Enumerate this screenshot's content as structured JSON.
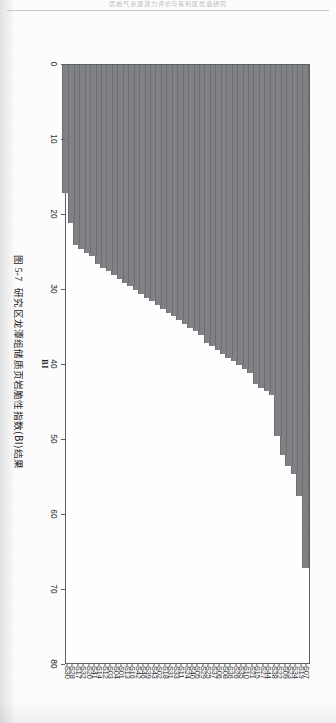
{
  "page": {
    "running_head": "页岩气资源潜力评价与有利区优选研究"
  },
  "figure": {
    "caption_number": "图 5-7",
    "caption_text": "研究区龙潭组储质页岩脆性指数(BI)结果",
    "bar_color": "#808285",
    "axis_color": "#5e6164"
  },
  "chart_data": {
    "type": "bar",
    "orientation": "horizontal",
    "xlabel": "BI",
    "ylabel": "",
    "xlim": [
      0,
      80
    ],
    "xticks": [
      0,
      10,
      20,
      30,
      40,
      50,
      60,
      70,
      80
    ],
    "xtick_labels": [
      "0",
      "10",
      "20",
      "30",
      "40",
      "50",
      "60",
      "70",
      "80"
    ],
    "grid": false,
    "legend": false,
    "categories": [
      "S07",
      "S19",
      "S34",
      "S23",
      "S09",
      "S22",
      "S38",
      "S44",
      "S27",
      "S15",
      "S21",
      "S10",
      "S35",
      "S26",
      "S36",
      "S08",
      "S06",
      "S37",
      "S25",
      "S29",
      "S05",
      "S40",
      "S24",
      "S11",
      "S33",
      "S31",
      "S18",
      "S02",
      "S43",
      "S39",
      "S46",
      "S42",
      "S16",
      "S13",
      "S01",
      "S04",
      "S03",
      "S12",
      "S14",
      "S41",
      "S20",
      "S32",
      "S17",
      "S28",
      "S30"
    ],
    "values": [
      67.0,
      57.5,
      54.5,
      53.5,
      52.0,
      49.5,
      44.0,
      43.5,
      43.0,
      42.5,
      41.0,
      40.5,
      40.0,
      39.5,
      39.0,
      38.5,
      38.0,
      37.5,
      37.0,
      36.0,
      35.5,
      35.0,
      34.5,
      34.0,
      33.5,
      33.0,
      32.5,
      32.0,
      31.5,
      31.0,
      30.5,
      30.0,
      29.5,
      29.0,
      28.5,
      28.0,
      27.5,
      27.0,
      26.5,
      25.5,
      25.0,
      24.5,
      24.0,
      21.0,
      17.0
    ]
  }
}
